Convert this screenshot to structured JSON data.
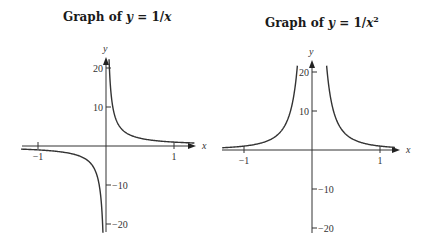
{
  "chart_data": [
    {
      "type": "line",
      "title": "Graph of y = 1/x",
      "title_parts": {
        "prefix": "Graph of ",
        "var": "y",
        "eq": " = 1/",
        "xvar": "x",
        "sup": ""
      },
      "xlabel": "x",
      "ylabel": "y",
      "xlim": [
        -1.25,
        1.3
      ],
      "ylim": [
        -22,
        23
      ],
      "x_ticks": [
        -1,
        1
      ],
      "x_tick_labels": [
        "−1",
        "1"
      ],
      "y_ticks": [
        20,
        10,
        -10,
        -20
      ],
      "y_tick_labels": [
        "20",
        "10",
        "−10",
        "−20"
      ],
      "grid": false,
      "function": "1/x",
      "series": [
        {
          "name": "y = 1/x (x>0)",
          "x": [
            0.045,
            0.05,
            0.1,
            0.2,
            0.3,
            0.5,
            0.75,
            1,
            1.25
          ],
          "y": [
            22.2,
            20,
            10,
            5,
            3.33,
            2,
            1.33,
            1,
            0.8
          ]
        },
        {
          "name": "y = 1/x (x<0)",
          "x": [
            -1.25,
            -1,
            -0.75,
            -0.5,
            -0.3,
            -0.2,
            -0.1,
            -0.05,
            -0.045
          ],
          "y": [
            -0.8,
            -1,
            -1.33,
            -2,
            -3.33,
            -5,
            -10,
            -20,
            -22.2
          ]
        }
      ]
    },
    {
      "type": "line",
      "title": "Graph of y = 1/x²",
      "title_parts": {
        "prefix": "Graph of ",
        "var": "y",
        "eq": " = 1/",
        "xvar": "x",
        "sup": "2"
      },
      "xlabel": "x",
      "ylabel": "y",
      "xlim": [
        -1.3,
        1.25
      ],
      "ylim": [
        -22,
        23
      ],
      "x_ticks": [
        -1,
        1
      ],
      "x_tick_labels": [
        "−1",
        "1"
      ],
      "y_ticks": [
        20,
        10,
        -10,
        -20
      ],
      "y_tick_labels": [
        "20",
        "10",
        "−10",
        "−20"
      ],
      "grid": false,
      "function": "1/x^2",
      "series": [
        {
          "name": "y = 1/x² (x>0)",
          "x": [
            0.215,
            0.25,
            0.3,
            0.4,
            0.5,
            0.75,
            1,
            1.2
          ],
          "y": [
            21.6,
            16,
            11.1,
            6.25,
            4,
            1.78,
            1,
            0.69
          ]
        },
        {
          "name": "y = 1/x² (x<0)",
          "x": [
            -1.3,
            -1,
            -0.75,
            -0.5,
            -0.4,
            -0.3,
            -0.25,
            -0.215
          ],
          "y": [
            0.59,
            1,
            1.78,
            4,
            6.25,
            11.1,
            16,
            21.6
          ]
        }
      ]
    }
  ]
}
